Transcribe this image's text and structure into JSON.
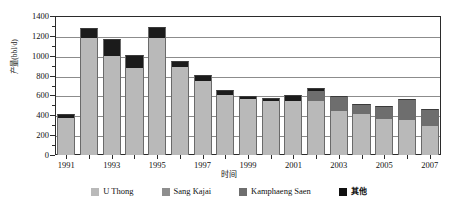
{
  "chart_data": {
    "type": "bar",
    "subtype": "stacked-bar",
    "title": "",
    "xlabel": "时间",
    "ylabel": "产量(bbl/d)",
    "ylim": [
      0,
      1400
    ],
    "ytick_step": 200,
    "yticks": [
      "0",
      "200",
      "400",
      "600",
      "800",
      "1000",
      "1200",
      "1400"
    ],
    "grid": true,
    "grid_axis": "y",
    "legend_position": "bottom",
    "categories": [
      "1991",
      "1992",
      "1993",
      "1994",
      "1995",
      "1996",
      "1997",
      "1998",
      "1999",
      "2000",
      "2001",
      "2002",
      "2003",
      "2004",
      "2005",
      "2006",
      "2007"
    ],
    "xtick_labels": [
      "1991",
      "",
      "1993",
      "",
      "1995",
      "",
      "1997",
      "",
      "1999",
      "",
      "2001",
      "",
      "2003",
      "",
      "2005",
      "",
      "2007"
    ],
    "series": [
      {
        "name": "U Thong",
        "color": "#b9b9b9",
        "values": [
          370,
          1180,
          1000,
          880,
          1180,
          890,
          750,
          600,
          560,
          545,
          545,
          545,
          440,
          415,
          360,
          350,
          290
        ]
      },
      {
        "name": "Sang Kajai",
        "color": "#8e8e8e",
        "values": [
          0,
          0,
          0,
          0,
          0,
          0,
          0,
          0,
          0,
          0,
          0,
          0,
          0,
          0,
          0,
          0,
          0
        ]
      },
      {
        "name": "Kamphaeng Saen",
        "color": "#6e6e6e",
        "values": [
          0,
          0,
          0,
          0,
          0,
          0,
          0,
          0,
          0,
          0,
          0,
          100,
          150,
          100,
          135,
          210,
          175
        ]
      },
      {
        "name": "其他",
        "color": "#111111",
        "values": [
          40,
          100,
          170,
          130,
          105,
          60,
          55,
          50,
          35,
          30,
          55,
          30,
          0,
          0,
          0,
          0,
          0
        ]
      }
    ],
    "totals": [
      410,
      1280,
      1170,
      1010,
      1285,
      950,
      805,
      650,
      595,
      575,
      600,
      675,
      590,
      515,
      495,
      560,
      465
    ]
  },
  "legend": {
    "items": [
      {
        "label": "U Thong",
        "swatch": "s0"
      },
      {
        "label": "Sang Kajai",
        "swatch": "s1"
      },
      {
        "label": "Kamphaeng Saen",
        "swatch": "s2"
      },
      {
        "label": "其他",
        "swatch": "s3"
      }
    ]
  }
}
